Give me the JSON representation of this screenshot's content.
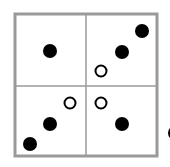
{
  "diagram": {
    "type": "2x2 grid of dots",
    "colors": {
      "border": "#9a9a9a",
      "filled": "#000000",
      "open_stroke": "#000000",
      "background": "#ffffff"
    },
    "grid": {
      "x": 14,
      "y": 13,
      "size": 144,
      "mid": 86
    },
    "dots": [
      {
        "quadrant": "top-left",
        "cx": 50,
        "cy": 51,
        "filled": true
      },
      {
        "quadrant": "top-right",
        "cx": 142,
        "cy": 31,
        "filled": true
      },
      {
        "quadrant": "top-right",
        "cx": 122,
        "cy": 52,
        "filled": true
      },
      {
        "quadrant": "top-right",
        "cx": 101,
        "cy": 71,
        "filled": false
      },
      {
        "quadrant": "bottom-left",
        "cx": 70,
        "cy": 103,
        "filled": false
      },
      {
        "quadrant": "bottom-left",
        "cx": 50,
        "cy": 124,
        "filled": true
      },
      {
        "quadrant": "bottom-left",
        "cx": 30,
        "cy": 144,
        "filled": true
      },
      {
        "quadrant": "bottom-right",
        "cx": 101,
        "cy": 103,
        "filled": false
      },
      {
        "quadrant": "bottom-right",
        "cx": 122,
        "cy": 124,
        "filled": true
      },
      {
        "quadrant": "outside-right",
        "cx": 175,
        "cy": 133,
        "filled": true
      }
    ]
  }
}
